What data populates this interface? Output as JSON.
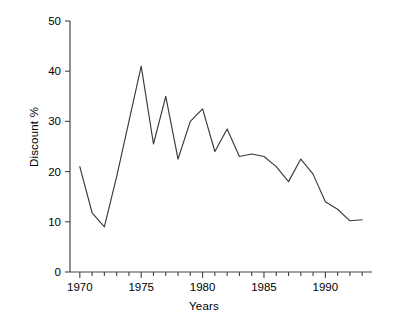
{
  "chart_data": {
    "type": "line",
    "title": "",
    "xlabel": "Years",
    "ylabel": "Discount %",
    "xlim": [
      1969.2,
      1993.8
    ],
    "ylim": [
      0,
      50
    ],
    "grid": false,
    "legend": "none",
    "y_ticks": [
      0,
      10,
      20,
      30,
      40,
      50
    ],
    "y_tick_labels": [
      "0",
      "10",
      "20",
      "30",
      "40",
      "50"
    ],
    "x_ticks": [
      1970,
      1971,
      1972,
      1973,
      1974,
      1975,
      1976,
      1977,
      1978,
      1979,
      1980,
      1981,
      1982,
      1983,
      1984,
      1985,
      1986,
      1987,
      1988,
      1989,
      1990,
      1991,
      1992,
      1993
    ],
    "x_tick_labels": [
      "1970",
      "1975",
      "1980",
      "1985",
      "1990"
    ],
    "x_labeled_ticks": [
      1970,
      1975,
      1980,
      1985,
      1990
    ],
    "line_color": "#3a3a3a",
    "x": [
      1970,
      1971,
      1972,
      1973,
      1974,
      1975,
      1976,
      1977,
      1978,
      1979,
      1980,
      1981,
      1982,
      1983,
      1984,
      1985,
      1986,
      1987,
      1988,
      1989,
      1990,
      1991,
      1992,
      1993
    ],
    "values": [
      21.0,
      11.8,
      9.0,
      19.0,
      30.0,
      41.0,
      25.5,
      35.0,
      22.5,
      30.0,
      32.5,
      24.0,
      28.5,
      23.0,
      23.5,
      23.0,
      21.0,
      18.0,
      22.5,
      19.5,
      14.0,
      12.5,
      10.2,
      10.4
    ],
    "series": [
      {
        "name": "Discount %",
        "values": [
          21.0,
          11.8,
          9.0,
          19.0,
          30.0,
          41.0,
          25.5,
          35.0,
          22.5,
          30.0,
          32.5,
          24.0,
          28.5,
          23.0,
          23.5,
          23.0,
          21.0,
          18.0,
          22.5,
          19.5,
          14.0,
          12.5,
          10.2,
          10.4
        ]
      }
    ]
  },
  "axes": {
    "y_title": "Discount %",
    "x_title": "Years"
  }
}
